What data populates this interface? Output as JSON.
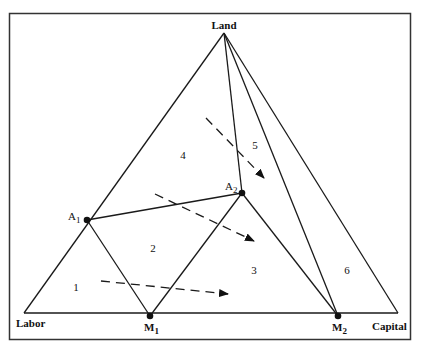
{
  "diagram": {
    "type": "ternary-simplex",
    "vertices": {
      "land": {
        "label": "Land",
        "x": 224,
        "y": 33
      },
      "labor": {
        "label": "Labor",
        "x": 24,
        "y": 313
      },
      "capital": {
        "label": "Capital",
        "x": 398,
        "y": 313
      }
    },
    "points": [
      {
        "id": "A1",
        "label": "A",
        "subscript": "1",
        "x": 87,
        "y": 220
      },
      {
        "id": "A2",
        "label": "A",
        "subscript": "2",
        "x": 242,
        "y": 193
      },
      {
        "id": "M1",
        "label": "M",
        "subscript": "1",
        "x": 150,
        "y": 316
      },
      {
        "id": "M2",
        "label": "M",
        "subscript": "2",
        "x": 338,
        "y": 316
      }
    ],
    "regions": [
      {
        "label": "1",
        "x": 76,
        "y": 288
      },
      {
        "label": "2",
        "x": 153,
        "y": 249
      },
      {
        "label": "3",
        "x": 254,
        "y": 271
      },
      {
        "label": "4",
        "x": 183,
        "y": 156
      },
      {
        "label": "5",
        "x": 255,
        "y": 146
      },
      {
        "label": "6",
        "x": 347,
        "y": 271
      }
    ],
    "arrows": [
      {
        "from": [
          101,
          281
        ],
        "to": [
          228,
          294
        ]
      },
      {
        "from": [
          155,
          194
        ],
        "to": [
          254,
          241
        ]
      },
      {
        "from": [
          206,
          118
        ],
        "to": [
          264,
          178
        ]
      }
    ],
    "colors": {
      "line": "#1a1a1a",
      "frame": "#333333",
      "background": "#ffffff"
    }
  }
}
